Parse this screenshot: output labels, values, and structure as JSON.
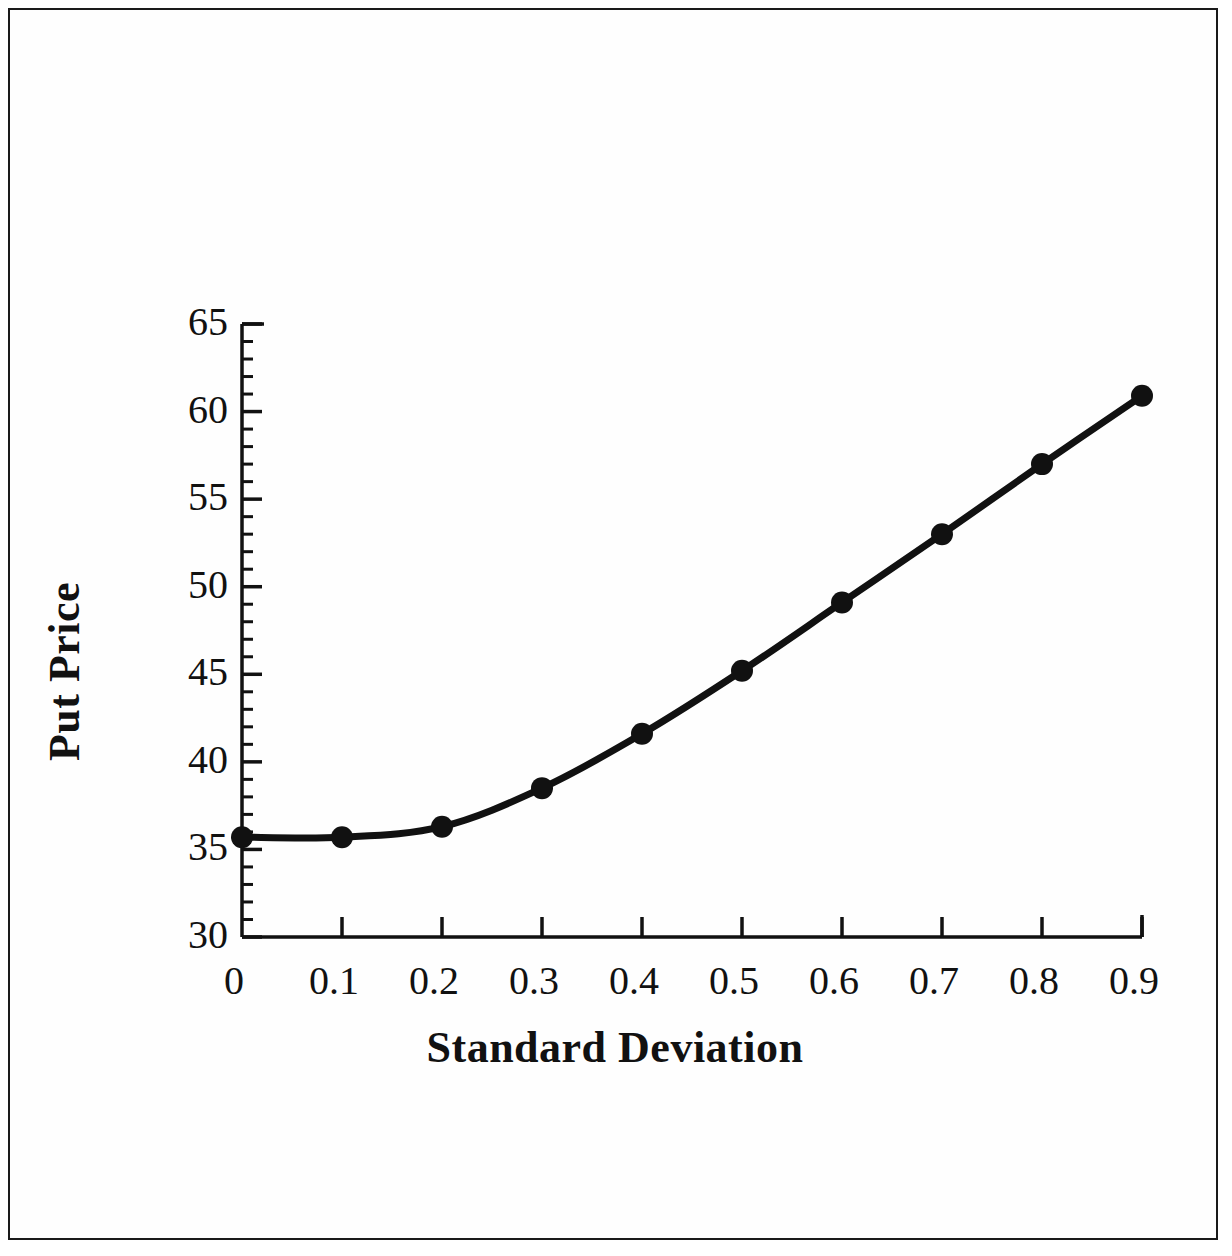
{
  "figure": {
    "background_color": "#ffffff",
    "frame_color": "#1a1a1a",
    "series_color": "#111111"
  },
  "chart_data": {
    "type": "line",
    "title": "",
    "xlabel": "Standard Deviation",
    "ylabel": "Put Price",
    "x": [
      0,
      0.1,
      0.2,
      0.3,
      0.4,
      0.5,
      0.6,
      0.7,
      0.8,
      0.9
    ],
    "values": [
      35.7,
      35.7,
      36.3,
      38.5,
      41.6,
      45.2,
      49.1,
      53.0,
      57.0,
      60.9
    ],
    "series": [
      {
        "name": "Put Price",
        "values": [
          35.7,
          35.7,
          36.3,
          38.5,
          41.6,
          45.2,
          49.1,
          53.0,
          57.0,
          60.9
        ]
      }
    ],
    "xlim": [
      0,
      0.9
    ],
    "ylim": [
      30,
      65
    ],
    "x_ticks": [
      0,
      0.1,
      0.2,
      0.3,
      0.4,
      0.5,
      0.6,
      0.7,
      0.8,
      0.9
    ],
    "x_tick_labels": [
      "0",
      "0.1",
      "0.2",
      "0.3",
      "0.4",
      "0.5",
      "0.6",
      "0.7",
      "0.8",
      "0.9"
    ],
    "y_ticks": [
      30,
      35,
      40,
      45,
      50,
      55,
      60,
      65
    ],
    "y_tick_labels": [
      "30",
      "35",
      "40",
      "45",
      "50",
      "55",
      "60",
      "65"
    ],
    "y_minor_tick_step": 1,
    "grid": false,
    "legend": false,
    "legend_position": "none",
    "marker": "filled-circle",
    "line_width": 7
  }
}
